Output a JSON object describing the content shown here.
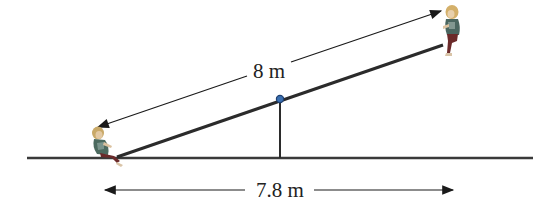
{
  "diagram": {
    "type": "seesaw",
    "plank_length_label": "8 m",
    "horizontal_span_label": "7.8 m",
    "colors": {
      "line": "#2b2b2b",
      "pivot_fill": "#3a6fb0",
      "pivot_stroke": "#1f3f70",
      "background": "#ffffff"
    },
    "figures": [
      {
        "name": "child-left",
        "position": "lower end, at ground"
      },
      {
        "name": "child-right",
        "position": "raised end"
      }
    ]
  }
}
